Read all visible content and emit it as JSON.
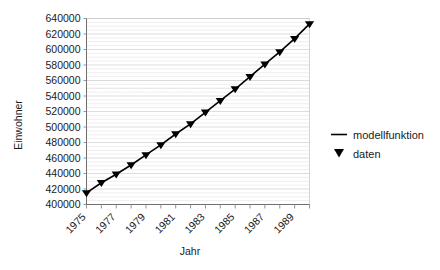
{
  "chart_data": {
    "type": "line",
    "title": "",
    "xlabel": "Jahr",
    "ylabel": "Einwohner",
    "xlim": [
      1975,
      1990
    ],
    "ylim": [
      400000,
      640000
    ],
    "grid": true,
    "legend_position": "right",
    "x_tick_labels": [
      "1975",
      "1977",
      "1979",
      "1981",
      "1983",
      "1985",
      "1987",
      "1989"
    ],
    "x_tick_values": [
      1975,
      1977,
      1979,
      1981,
      1983,
      1985,
      1987,
      1989
    ],
    "y_tick_labels": [
      "400000",
      "420000",
      "440000",
      "460000",
      "480000",
      "500000",
      "520000",
      "540000",
      "560000",
      "580000",
      "600000",
      "620000",
      "640000"
    ],
    "y_tick_values": [
      400000,
      420000,
      440000,
      460000,
      480000,
      500000,
      520000,
      540000,
      560000,
      580000,
      600000,
      620000,
      640000
    ],
    "x": [
      1975,
      1976,
      1977,
      1978,
      1979,
      1980,
      1981,
      1982,
      1983,
      1984,
      1985,
      1986,
      1987,
      1988,
      1989,
      1990
    ],
    "series": [
      {
        "name": "modellfunktion",
        "style": "line",
        "values": [
          415000,
          428000,
          439000,
          451000,
          464000,
          477000,
          491000,
          504000,
          519000,
          534000,
          549000,
          565000,
          581000,
          597000,
          614000,
          633000
        ]
      },
      {
        "name": "daten",
        "style": "marker",
        "marker": "triangle-down",
        "values": [
          415000,
          428000,
          439000,
          451000,
          464000,
          477000,
          491000,
          504000,
          519000,
          534000,
          549000,
          565000,
          581000,
          597000,
          614000,
          633000
        ]
      }
    ],
    "legend": [
      {
        "label": "modellfunktion",
        "marker": "line",
        "color": "#000000"
      },
      {
        "label": "daten",
        "marker": "triangle-down",
        "color": "#000000"
      }
    ]
  },
  "colors": {
    "series": "#000000",
    "grid_major": "#d4d4d4",
    "grid_minor": "#e6e6e6",
    "axis": "#6f6f6f",
    "text": "#1a1a1a",
    "background": "#ffffff"
  }
}
